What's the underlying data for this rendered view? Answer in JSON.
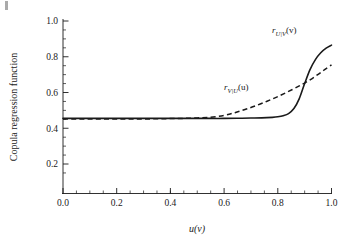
{
  "figure": {
    "background_color": "#ffffff",
    "line_color": "#1a1a1a",
    "corner_artifact": "page-edge-mark"
  },
  "chart_data": {
    "type": "line",
    "title": "",
    "xlabel": "u(v)",
    "ylabel": "Copula regression function",
    "xlim": [
      0.0,
      1.0
    ],
    "ylim": [
      0.1,
      1.0
    ],
    "grid": false,
    "legend_position": "inline-annotations",
    "xticks": [
      "0.0",
      "0.2",
      "0.4",
      "0.6",
      "0.8",
      "1.0"
    ],
    "xtick_values": [
      0.0,
      0.2,
      0.4,
      0.6,
      0.8,
      1.0
    ],
    "yticks": [
      "0.2",
      "0.4",
      "0.6",
      "0.8",
      "1.0"
    ],
    "ytick_values": [
      0.2,
      0.4,
      0.6,
      0.8,
      1.0
    ],
    "minor_ticks": true,
    "frame": "left-bottom-spines",
    "series": [
      {
        "name": "r_U|V(v)",
        "label_text": "r",
        "label_sub": "U|V",
        "label_arg": "(v)",
        "style": "solid",
        "color": "#1a1a1a",
        "x": [
          0.0,
          0.05,
          0.1,
          0.15,
          0.2,
          0.25,
          0.3,
          0.35,
          0.4,
          0.45,
          0.5,
          0.55,
          0.6,
          0.65,
          0.7,
          0.74,
          0.78,
          0.8,
          0.82,
          0.84,
          0.86,
          0.88,
          0.9,
          0.92,
          0.94,
          0.96,
          0.98,
          1.0
        ],
        "y": [
          0.455,
          0.455,
          0.455,
          0.455,
          0.455,
          0.455,
          0.455,
          0.455,
          0.455,
          0.455,
          0.455,
          0.455,
          0.455,
          0.456,
          0.457,
          0.458,
          0.461,
          0.464,
          0.47,
          0.482,
          0.51,
          0.566,
          0.65,
          0.728,
          0.784,
          0.822,
          0.848,
          0.865
        ]
      },
      {
        "name": "r_V|U(u)",
        "label_text": "r",
        "label_sub": "V|U",
        "label_arg": "(u)",
        "style": "dashed",
        "color": "#1a1a1a",
        "x": [
          0.0,
          0.05,
          0.1,
          0.15,
          0.2,
          0.25,
          0.3,
          0.35,
          0.4,
          0.45,
          0.5,
          0.55,
          0.6,
          0.64,
          0.68,
          0.72,
          0.76,
          0.8,
          0.84,
          0.88,
          0.9,
          0.92,
          0.94,
          0.96,
          0.98,
          1.0
        ],
        "y": [
          0.452,
          0.452,
          0.452,
          0.452,
          0.452,
          0.452,
          0.452,
          0.453,
          0.454,
          0.455,
          0.458,
          0.462,
          0.472,
          0.487,
          0.506,
          0.527,
          0.551,
          0.577,
          0.606,
          0.637,
          0.653,
          0.671,
          0.691,
          0.712,
          0.734,
          0.755
        ]
      }
    ],
    "annotations": [
      {
        "name": "label-r-u-given-v",
        "x": 0.865,
        "y": 0.935
      },
      {
        "name": "label-r-v-given-u",
        "x": 0.64,
        "y": 0.64
      }
    ]
  }
}
